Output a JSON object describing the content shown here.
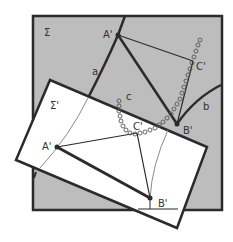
{
  "figure": {
    "type": "geometric diagram",
    "colors": {
      "background": "#ffffff",
      "plane_sigma_fill": "#bdbdbd",
      "plane_sigma_prime_fill": "#ffffff",
      "stroke": "#2b2b2b",
      "thin_curve": "#8a8a8a"
    },
    "plane_sigma": {
      "label": "Σ",
      "points": {
        "A": {
          "label": "A'"
        },
        "B": {
          "label": "B'"
        },
        "C": {
          "label": "C'"
        }
      },
      "curves": {
        "a": {
          "label": "a"
        },
        "b": {
          "label": "b"
        },
        "c": {
          "label": "c"
        }
      }
    },
    "plane_sigma_prime": {
      "label": "Σ'",
      "points": {
        "A": {
          "label": "A'"
        },
        "B": {
          "label": "B'"
        },
        "C": {
          "label": "C'"
        }
      }
    }
  }
}
